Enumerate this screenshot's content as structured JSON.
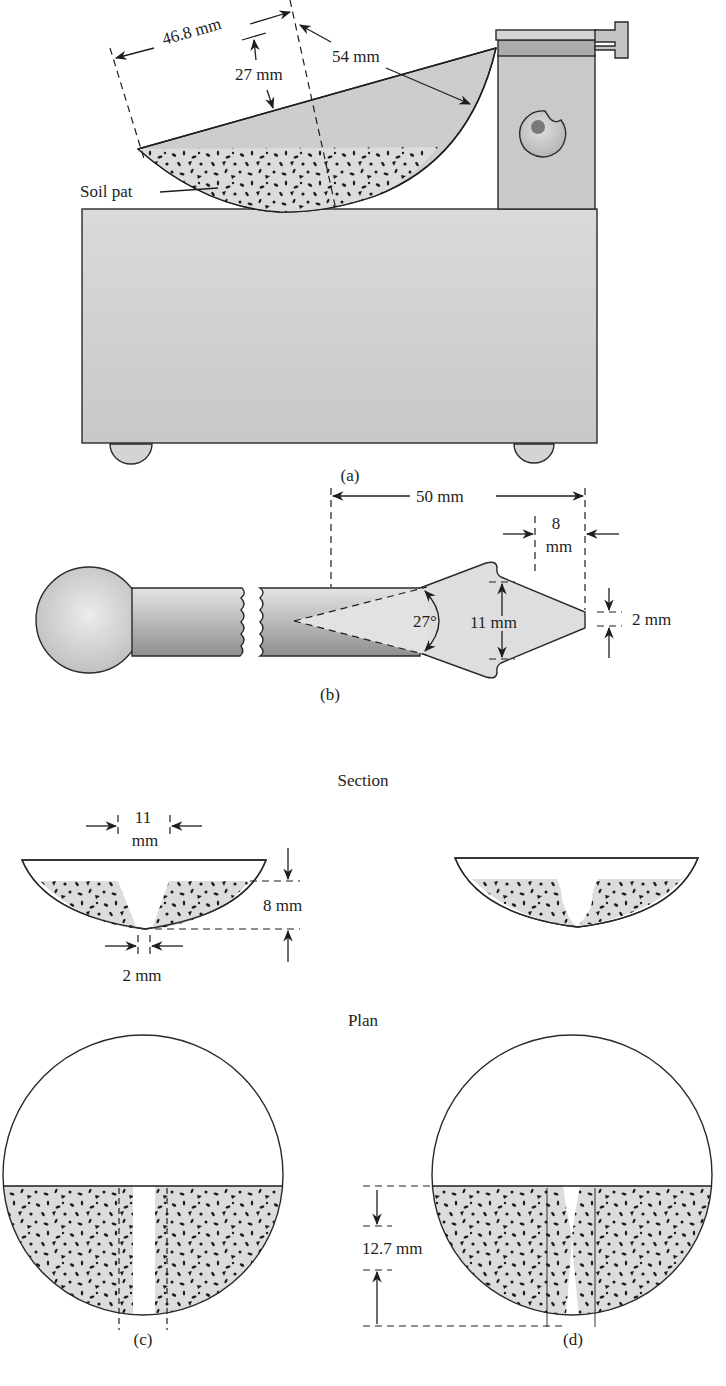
{
  "figure": {
    "panels": [
      {
        "id": "a",
        "caption": "(a)",
        "title": "Casagrande liquid limit device (side view)",
        "labels": {
          "chord": "46.8 mm",
          "depth": "27 mm",
          "radius": "54 mm",
          "soil_pat": "Soil pat"
        }
      },
      {
        "id": "b",
        "caption": "(b)",
        "title": "Grooving tool",
        "labels": {
          "length": "50 mm",
          "tip_length_num": "8",
          "tip_length_unit": "mm",
          "angle": "27°",
          "width": "11 mm",
          "tip_width": "2 mm"
        }
      },
      {
        "id": "c",
        "caption": "(c)",
        "section_heading": "Section",
        "plan_heading": "Plan",
        "labels": {
          "top_width_num": "11",
          "top_width_unit": "mm",
          "depth": "8 mm",
          "bottom_width": "2 mm"
        }
      },
      {
        "id": "d",
        "caption": "(d)",
        "labels": {
          "closure": "12.7 mm"
        }
      }
    ],
    "colors": {
      "fill_gray": "#d6d6d6",
      "soil_gray": "#dcdcdc",
      "dark_gray": "#9a9a9a",
      "speckle": "#1a1a1a",
      "line": "#1e1e1e"
    }
  }
}
